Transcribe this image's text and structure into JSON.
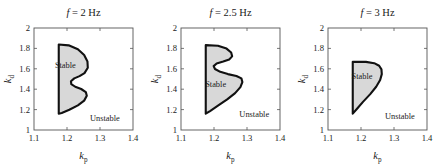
{
  "figure": {
    "width": 441,
    "height": 167,
    "background": "#ffffff",
    "panel_count": 3
  },
  "style": {
    "stable_fill": "#d8d8d8",
    "stable_stroke": "#111111",
    "axis_stroke": "#555555",
    "text_color": "#1a1a1a"
  },
  "chart_data": [
    {
      "type": "area",
      "title": "f = 2 Hz",
      "title_symbol": "f",
      "title_value": "2",
      "title_unit": "Hz",
      "xlabel": "k_p",
      "xlabel_base": "k",
      "xlabel_sub": "p",
      "ylabel": "k_d",
      "ylabel_base": "k",
      "ylabel_sub": "d",
      "xlim": [
        1.1,
        1.4
      ],
      "ylim": [
        1,
        2
      ],
      "xticks": [
        1.1,
        1.2,
        1.3,
        1.4
      ],
      "xticklabels": [
        "1.1",
        "1.2",
        "1.3",
        "1.4"
      ],
      "yticks": [
        1,
        1.2,
        1.4,
        1.6,
        1.8,
        2
      ],
      "yticklabels": [
        "1",
        "1.2",
        "1.4",
        "1.6",
        "1.8",
        "2"
      ],
      "grid": false,
      "legend": "none",
      "annotations": [
        {
          "text": "Stable",
          "x": 1.195,
          "y": 1.635
        },
        {
          "text": "Unstable",
          "x": 1.315,
          "y": 1.115
        }
      ],
      "series": [
        {
          "name": "Stable region boundary",
          "fill": "#d8d8d8",
          "closed": true,
          "points": [
            [
              1.175,
              1.838
            ],
            [
              1.205,
              1.83
            ],
            [
              1.233,
              1.792
            ],
            [
              1.252,
              1.735
            ],
            [
              1.262,
              1.672
            ],
            [
              1.263,
              1.61
            ],
            [
              1.253,
              1.558
            ],
            [
              1.238,
              1.528
            ],
            [
              1.222,
              1.506
            ],
            [
              1.212,
              1.478
            ],
            [
              1.213,
              1.45
            ],
            [
              1.225,
              1.424
            ],
            [
              1.243,
              1.402
            ],
            [
              1.257,
              1.372
            ],
            [
              1.26,
              1.335
            ],
            [
              1.252,
              1.288
            ],
            [
              1.233,
              1.242
            ],
            [
              1.207,
              1.198
            ],
            [
              1.184,
              1.167
            ],
            [
              1.175,
              1.16
            ]
          ]
        }
      ]
    },
    {
      "type": "area",
      "title": "f = 2.5 Hz",
      "title_symbol": "f",
      "title_value": "2.5",
      "title_unit": "Hz",
      "xlabel": "k_p",
      "xlabel_base": "k",
      "xlabel_sub": "p",
      "ylabel": "k_d",
      "ylabel_base": "k",
      "ylabel_sub": "d",
      "xlim": [
        1.1,
        1.4
      ],
      "ylim": [
        1,
        2
      ],
      "xticks": [
        1.1,
        1.2,
        1.3,
        1.4
      ],
      "xticklabels": [
        "1.1",
        "1.2",
        "1.3",
        "1.4"
      ],
      "yticks": [
        1,
        1.2,
        1.4,
        1.6,
        1.8,
        2
      ],
      "yticklabels": [
        "1",
        "1.2",
        "1.4",
        "1.6",
        "1.8",
        "2"
      ],
      "grid": false,
      "legend": "none",
      "annotations": [
        {
          "text": "Stable",
          "x": 1.205,
          "y": 1.455
        },
        {
          "text": "Unstable",
          "x": 1.322,
          "y": 1.155
        }
      ],
      "series": [
        {
          "name": "Stable region boundary",
          "fill": "#d8d8d8",
          "closed": true,
          "points": [
            [
              1.175,
              1.832
            ],
            [
              1.212,
              1.826
            ],
            [
              1.238,
              1.798
            ],
            [
              1.252,
              1.76
            ],
            [
              1.255,
              1.722
            ],
            [
              1.246,
              1.692
            ],
            [
              1.228,
              1.672
            ],
            [
              1.208,
              1.652
            ],
            [
              1.199,
              1.626
            ],
            [
              1.203,
              1.598
            ],
            [
              1.219,
              1.57
            ],
            [
              1.242,
              1.548
            ],
            [
              1.268,
              1.53
            ],
            [
              1.283,
              1.506
            ],
            [
              1.286,
              1.47
            ],
            [
              1.28,
              1.42
            ],
            [
              1.264,
              1.362
            ],
            [
              1.24,
              1.3
            ],
            [
              1.212,
              1.238
            ],
            [
              1.188,
              1.186
            ],
            [
              1.175,
              1.16
            ]
          ]
        }
      ]
    },
    {
      "type": "area",
      "title": "f = 3 Hz",
      "title_symbol": "f",
      "title_value": "3",
      "title_unit": "Hz",
      "xlabel": "k_p",
      "xlabel_base": "k",
      "xlabel_sub": "p",
      "ylabel": "k_d",
      "ylabel_base": "k",
      "ylabel_sub": "d",
      "xlim": [
        1.1,
        1.4
      ],
      "ylim": [
        1,
        2
      ],
      "xticks": [
        1.1,
        1.2,
        1.3,
        1.4
      ],
      "xticklabels": [
        "1.1",
        "1.2",
        "1.3",
        "1.4"
      ],
      "yticks": [
        1,
        1.2,
        1.4,
        1.6,
        1.8,
        2
      ],
      "yticklabels": [
        "1",
        "1.2",
        "1.4",
        "1.6",
        "1.8",
        "2"
      ],
      "grid": false,
      "legend": "none",
      "annotations": [
        {
          "text": "Stable",
          "x": 1.203,
          "y": 1.525
        },
        {
          "text": "Unstable",
          "x": 1.318,
          "y": 1.14
        }
      ],
      "series": [
        {
          "name": "Stable region boundary",
          "fill": "#d8d8d8",
          "closed": true,
          "points": [
            [
              1.175,
              1.668
            ],
            [
              1.215,
              1.668
            ],
            [
              1.24,
              1.655
            ],
            [
              1.255,
              1.63
            ],
            [
              1.262,
              1.595
            ],
            [
              1.263,
              1.548
            ],
            [
              1.258,
              1.49
            ],
            [
              1.246,
              1.424
            ],
            [
              1.228,
              1.352
            ],
            [
              1.206,
              1.276
            ],
            [
              1.188,
              1.208
            ],
            [
              1.175,
              1.16
            ]
          ]
        }
      ]
    }
  ]
}
